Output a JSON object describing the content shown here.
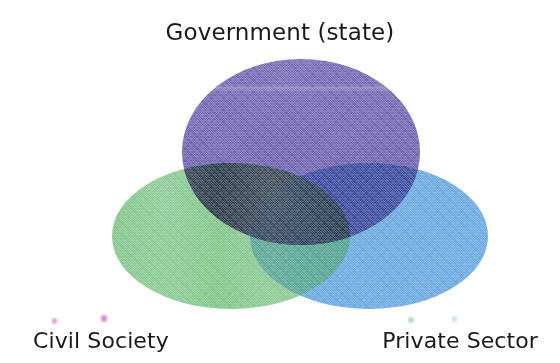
{
  "figure": {
    "type": "venn-diagram",
    "set_count": 3,
    "background_color": "#ffffff",
    "label_color": "#1a1a1a"
  },
  "labels": {
    "government": "Government (state)",
    "civil_society": "Civil Society",
    "private_sector": "Private Sector"
  },
  "sets": [
    {
      "id": "government",
      "label": "Government (state)",
      "color": "#6f63b0",
      "label_position": "top-center",
      "cx": 301,
      "cy": 152,
      "rx": 119,
      "ry": 93
    },
    {
      "id": "civil-society",
      "label": "Civil Society",
      "color": "#80c58a",
      "label_position": "bottom-left",
      "cx": 231,
      "cy": 236,
      "rx": 119,
      "ry": 73
    },
    {
      "id": "private-sector",
      "label": "Private Sector",
      "color": "#6aa8e0",
      "label_position": "bottom-right",
      "cx": 369,
      "cy": 236,
      "rx": 119,
      "ry": 73
    }
  ],
  "intersections": [
    {
      "id": "government-civil-society",
      "sets": [
        "government",
        "civil-society"
      ],
      "color": "#2b3a4a"
    },
    {
      "id": "government-private-sector",
      "sets": [
        "government",
        "private-sector"
      ],
      "color": "#3a4a9e"
    },
    {
      "id": "civil-society-private-sector",
      "sets": [
        "civil-society",
        "private-sector"
      ],
      "color": "#4e9f8e"
    },
    {
      "id": "all-three",
      "sets": [
        "government",
        "civil-society",
        "private-sector"
      ],
      "color": "#243a52"
    }
  ]
}
